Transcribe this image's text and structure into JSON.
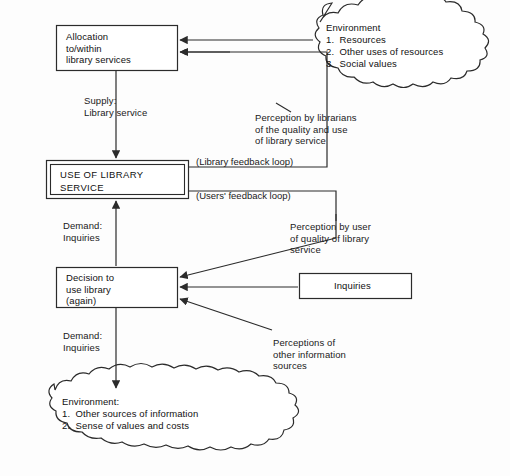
{
  "diagram": {
    "line_color": "#2b2b2b",
    "text_color": "#111111",
    "background": "#fdfdfd",
    "nodes": {
      "allocation": {
        "label": "Allocation\nto/within\nlibrary services",
        "shape": "rect"
      },
      "use_of_library": {
        "label": "USE OF LIBRARY\nSERVICE",
        "shape": "double-rect"
      },
      "decision": {
        "label": "Decision to\nuse library\n(again)",
        "shape": "rect"
      },
      "inquiries_box": {
        "label": "Inquiries",
        "shape": "rect"
      },
      "environment_top": {
        "label": "Environment\n1.  Resources\n2.  Other uses of resources\n3.  Social values",
        "shape": "cloud"
      },
      "environment_bottom": {
        "label": "Environment:\n1.  Other sources of information\n2.  Sense of values and costs",
        "shape": "cloud"
      }
    },
    "edge_labels": {
      "supply": "Supply:\nLibrary service",
      "demand_upper": "Demand:\nInquiries",
      "demand_lower": "Demand:\nInquiries",
      "perception_librarians": "Perception by librarians\nof the quality and use\nof library service",
      "perception_user": "Perception by user\nof quality of library\nservice",
      "perceptions_other": "Perceptions of\nother information\nsources",
      "library_feedback_loop": "(Library feedback loop)",
      "users_feedback_loop": "(Users' feedback loop)"
    }
  }
}
